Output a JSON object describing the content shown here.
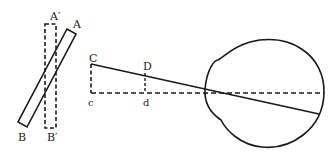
{
  "diagram": {
    "labels": {
      "A": "A",
      "A_prime": "A′",
      "B": "B",
      "B_prime": "B′",
      "C": "C",
      "c": "c",
      "D": "D",
      "d": "d"
    },
    "colors": {
      "line": "#1a1a1a",
      "background": "#ffffff"
    }
  }
}
